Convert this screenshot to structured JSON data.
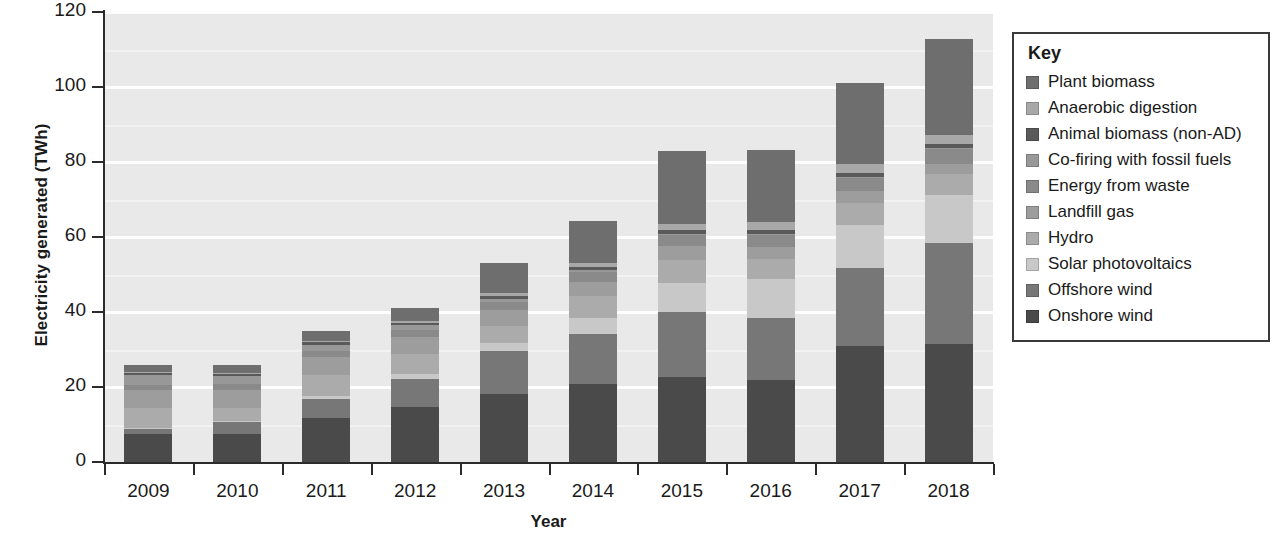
{
  "chart_data": {
    "type": "bar",
    "subtype": "stacked-bar",
    "title": "",
    "xlabel": "Year",
    "ylabel": "Electricity generated (TWh)",
    "categories": [
      "2009",
      "2010",
      "2011",
      "2012",
      "2013",
      "2014",
      "2015",
      "2016",
      "2017",
      "2018"
    ],
    "ylim": [
      0,
      120
    ],
    "yticks": [
      0,
      20,
      40,
      60,
      80,
      100,
      120
    ],
    "ytick_labels": [
      "0",
      "20",
      "40",
      "60",
      "80",
      "100",
      "120"
    ],
    "grid": true,
    "legend_position": "right-outside",
    "legend_title": "Key",
    "stack_order_bottom_to_top": [
      "Onshore wind",
      "Offshore wind",
      "Solar photovoltaics",
      "Hydro",
      "Landfill gas",
      "Energy from waste",
      "Co-firing with fossil fuels",
      "Animal biomass (non-AD)",
      "Anaerobic digestion",
      "Plant biomass"
    ],
    "series": [
      {
        "name": "Plant biomass",
        "color": "#6e6e6e",
        "values": [
          2.1,
          2.3,
          2.8,
          3.5,
          8.0,
          11.1,
          19.4,
          19.2,
          21.7,
          25.5
        ]
      },
      {
        "name": "Anaerobic digestion",
        "color": "#a8a8a8",
        "values": [
          0.2,
          0.2,
          0.3,
          0.4,
          0.7,
          1.2,
          1.8,
          2.1,
          2.4,
          2.6
        ]
      },
      {
        "name": "Animal biomass (non-AD)",
        "color": "#5a5a5a",
        "values": [
          0.5,
          0.5,
          0.6,
          0.6,
          0.7,
          0.8,
          0.9,
          0.9,
          1.0,
          1.0
        ]
      },
      {
        "name": "Co-firing with fossil fuels",
        "color": "#989898",
        "values": [
          2.6,
          2.2,
          1.6,
          1.2,
          0.9,
          0.6,
          0.4,
          0.3,
          0.3,
          0.3
        ]
      },
      {
        "name": "Energy from waste",
        "color": "#8a8a8a",
        "values": [
          1.4,
          1.5,
          1.7,
          1.9,
          2.2,
          2.5,
          2.9,
          3.2,
          3.6,
          4.0
        ]
      },
      {
        "name": "Landfill gas",
        "color": "#9d9d9d",
        "values": [
          4.9,
          4.8,
          4.7,
          4.5,
          4.2,
          3.9,
          3.6,
          3.3,
          3.0,
          2.7
        ]
      },
      {
        "name": "Hydro",
        "color": "#ababab",
        "values": [
          5.1,
          3.6,
          5.7,
          5.3,
          4.6,
          5.9,
          6.3,
          5.4,
          5.9,
          5.5
        ]
      },
      {
        "name": "Solar photovoltaics",
        "color": "#c8c8c8",
        "values": [
          0.1,
          0.3,
          0.8,
          1.4,
          2.0,
          4.1,
          7.6,
          10.4,
          11.5,
          12.9
        ]
      },
      {
        "name": "Offshore wind",
        "color": "#777777",
        "values": [
          1.5,
          3.0,
          5.1,
          7.5,
          11.5,
          13.4,
          17.4,
          16.4,
          20.9,
          26.7
        ]
      },
      {
        "name": "Onshore wind",
        "color": "#4a4a4a",
        "values": [
          7.6,
          7.6,
          11.7,
          14.7,
          18.2,
          20.8,
          22.7,
          21.9,
          30.9,
          31.6
        ]
      }
    ],
    "totals": [
      26.0,
      26.0,
      35.0,
      41.0,
      53.0,
      64.3,
      83.0,
      83.1,
      101.2,
      112.8
    ]
  },
  "legend": {
    "title": "Key",
    "items": [
      {
        "label": "Plant biomass",
        "color": "#6e6e6e"
      },
      {
        "label": "Anaerobic digestion",
        "color": "#a8a8a8"
      },
      {
        "label": "Animal biomass (non-AD)",
        "color": "#5a5a5a"
      },
      {
        "label": "Co-firing with fossil fuels",
        "color": "#989898"
      },
      {
        "label": "Energy from waste",
        "color": "#8a8a8a"
      },
      {
        "label": "Landfill gas",
        "color": "#9d9d9d"
      },
      {
        "label": "Hydro",
        "color": "#ababab"
      },
      {
        "label": "Solar photovoltaics",
        "color": "#c8c8c8"
      },
      {
        "label": "Offshore wind",
        "color": "#777777"
      },
      {
        "label": "Onshore wind",
        "color": "#4a4a4a"
      }
    ]
  },
  "axes": {
    "y_title": "Electricity generated (TWh)",
    "x_title": "Year"
  }
}
